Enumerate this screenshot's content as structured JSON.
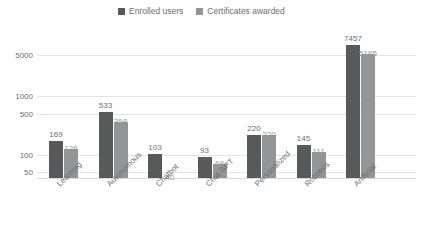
{
  "chart_data": {
    "type": "bar",
    "title": "Enrolled users and certificates awarded",
    "subtitle": "",
    "xlabel": "",
    "ylabel": "",
    "yscale": "log",
    "ylim": [
      40,
      9000
    ],
    "grid": true,
    "legend_position": "top-center",
    "categories": [
      "Learning",
      "Autonomous",
      "Chatbot",
      "Chat GPT",
      "Personalized",
      "Robotics",
      "Artificial"
    ],
    "ytick_labels": [
      "50",
      "100",
      "500",
      "1000",
      "5000"
    ],
    "ytick_values": [
      50,
      100,
      500,
      1000,
      5000
    ],
    "series": [
      {
        "name": "Enrolled users",
        "color": "#58595b",
        "values": [
          169,
          533,
          103,
          93,
          220,
          145,
          7457
        ],
        "labels": [
          "169",
          "533",
          "103",
          "93",
          "220",
          "145",
          "7457"
        ]
      },
      {
        "name": "Certificates awarded",
        "color": "#939598",
        "values": [
          126,
          358,
          40,
          68,
          220,
          111,
          5165
        ],
        "labels": [
          "126",
          "358",
          "40",
          "68",
          "220",
          "111",
          "5165"
        ]
      }
    ]
  },
  "colors": {
    "series_dark": "#58595b",
    "series_light": "#939598",
    "gridline": "#e3e3e4",
    "text": "#6d6e71",
    "background": "#ffffff"
  }
}
